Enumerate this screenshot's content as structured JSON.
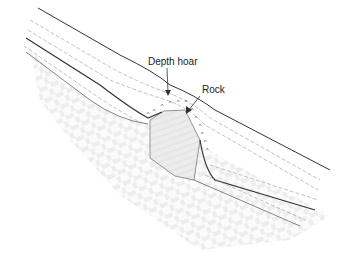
{
  "diagram": {
    "labels": {
      "depth_hoar": "Depth hoar",
      "rock": "Rock"
    },
    "colors": {
      "outline": "#333333",
      "layer_line": "#999999",
      "ground_hatch": "#cfcfcf",
      "rock_fill": "#e2e2e2",
      "background": "#ffffff"
    }
  }
}
